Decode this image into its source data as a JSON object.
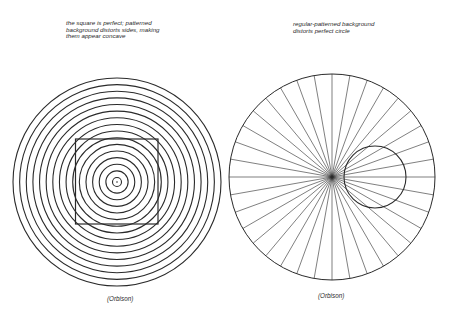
{
  "figures": [
    {
      "id": "concentric-square",
      "caption_lines": [
        "the square is perfect; patterned",
        "background distorts sides, making",
        "them appear concave"
      ],
      "credit": "(Orbison)",
      "ring_count": 16
    },
    {
      "id": "radial-circle",
      "caption_lines": [
        "regular-patterned background",
        "distorts perfect circle"
      ],
      "credit": "(Orbison)",
      "ray_count": 36
    }
  ],
  "colors": {
    "ink": "#2a2a2a",
    "background": "#ffffff"
  }
}
